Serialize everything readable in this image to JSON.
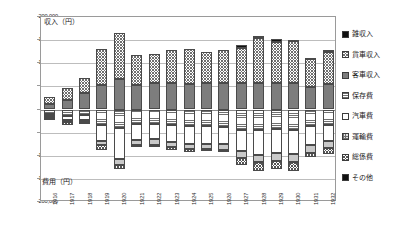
{
  "chart_data": {
    "type": "bar",
    "title": "",
    "subtitle": "",
    "orientation": "vertical-diverging",
    "stacked": true,
    "xlabel": "",
    "ylabel_top": "収入（円）",
    "ylabel_bottom": "費用（円）",
    "grid": true,
    "legend_position": "right",
    "ylim": [
      -200000,
      200000
    ],
    "yticks": [
      {
        "value": 200000,
        "label": "200,000"
      },
      {
        "value": 150000,
        "label": "150,000"
      },
      {
        "value": 100000,
        "label": "100,000"
      },
      {
        "value": 50000,
        "label": "50,000"
      },
      {
        "value": 0,
        "label": "0"
      },
      {
        "value": -50000,
        "label": "50,000"
      },
      {
        "value": -100000,
        "label": "100,000"
      },
      {
        "value": -150000,
        "label": "150,000"
      },
      {
        "value": -200000,
        "label": "200,000"
      }
    ],
    "categories": [
      "1916",
      "1917",
      "1918",
      "1919",
      "1920",
      "1921",
      "1922",
      "1923",
      "1924",
      "1925",
      "1926",
      "1927",
      "1928",
      "1929",
      "1930",
      "1931",
      "1932"
    ],
    "series": [
      {
        "name": "客車収入",
        "direction": "up",
        "pattern": "solid-dark-gray",
        "color": "#7d7d7d",
        "values": [
          12000,
          20500,
          35500,
          53000,
          65000,
          52500,
          56500,
          57500,
          56000,
          56500,
          57500,
          57000,
          57000,
          57500,
          57000,
          48500,
          55500
        ]
      },
      {
        "name": "貨車収入",
        "direction": "up",
        "pattern": "diagonal-crosshatch",
        "color": "#ffffff",
        "values": [
          14500,
          27000,
          32500,
          78500,
          99500,
          64500,
          63000,
          70500,
          74000,
          68500,
          71500,
          76000,
          97500,
          88000,
          90500,
          61000,
          68500
        ]
      },
      {
        "name": "雑収入",
        "direction": "up",
        "pattern": "solid-black",
        "color": "#111111",
        "values": [
          0,
          0,
          0,
          0,
          0,
          0,
          0,
          0,
          0,
          0,
          0,
          5500,
          5000,
          7500,
          3500,
          2500,
          5000
        ]
      },
      {
        "name": "保存費",
        "direction": "down",
        "pattern": "horizontal-lines",
        "color": "#ffffff",
        "values": [
          10500,
          15000,
          12500,
          34500,
          39000,
          31500,
          31000,
          34500,
          36000,
          36500,
          37000,
          44000,
          44500,
          43000,
          44000,
          36500,
          32500
        ]
      },
      {
        "name": "汽車費",
        "direction": "down",
        "pattern": "white",
        "color": "#ffffff",
        "values": [
          4500,
          8500,
          10500,
          34000,
          67000,
          34000,
          33500,
          36500,
          38000,
          37500,
          38500,
          45500,
          53500,
          52000,
          53000,
          40500,
          36500
        ]
      },
      {
        "name": "運輸費",
        "direction": "down",
        "pattern": "solid-light-gray",
        "color": "#c9c9c9",
        "values": [
          4000,
          3500,
          3500,
          9000,
          13000,
          10500,
          11500,
          11000,
          11500,
          11000,
          11500,
          16000,
          16500,
          16500,
          17000,
          16000,
          14500
        ]
      },
      {
        "name": "総係費",
        "direction": "down",
        "pattern": "checkerboard",
        "color": "#ffffff",
        "values": [
          3500,
          5500,
          5000,
          9000,
          9500,
          5500,
          5500,
          5500,
          5500,
          5500,
          5500,
          14500,
          18500,
          18000,
          18000,
          10500,
          12000
        ]
      },
      {
        "name": "その他",
        "direction": "down",
        "pattern": "solid-black",
        "color": "#111111",
        "values": [
          0,
          0,
          0,
          0,
          0,
          0,
          0,
          0,
          0,
          0,
          0,
          0,
          0,
          0,
          0,
          0,
          0
        ]
      }
    ]
  },
  "legend": {
    "items": [
      {
        "label": "雑収入",
        "pattern": "solid-black"
      },
      {
        "label": "貨車収入",
        "pattern": "diagonal-crosshatch"
      },
      {
        "label": "客車収入",
        "pattern": "solid-dark-gray"
      },
      {
        "label": "保存費",
        "pattern": "horizontal-lines"
      },
      {
        "label": "汽車費",
        "pattern": "white"
      },
      {
        "label": "運輸費",
        "pattern": "grid-fill"
      },
      {
        "label": "総係費",
        "pattern": "checkerboard"
      },
      {
        "label": "その他",
        "pattern": "solid-black"
      }
    ]
  }
}
